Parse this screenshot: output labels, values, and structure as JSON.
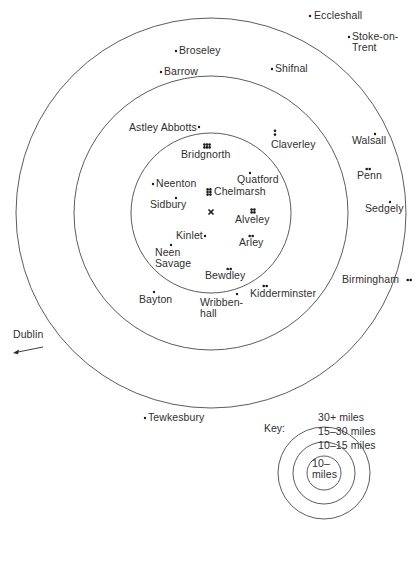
{
  "map": {
    "center_marker": {
      "x": 211,
      "y": 212,
      "symbol": "×",
      "label": ""
    },
    "rings": [
      {
        "name": "inner",
        "label": "10– miles",
        "cx": 211,
        "cy": 213,
        "r": 80
      },
      {
        "name": "middle",
        "label": "10–15 miles",
        "cx": 211,
        "cy": 213,
        "r": 137
      },
      {
        "name": "outer",
        "label": "15–30 miles",
        "cx": 211,
        "cy": 213,
        "r": 195
      }
    ],
    "places": [
      {
        "id": "eccleshall",
        "label": "Eccleshall",
        "dots": 1,
        "dot_x": 310,
        "dot_y": 16,
        "lx": 314,
        "ly": 10
      },
      {
        "id": "stoke-on-trent",
        "label": "Stoke-on-\nTrent",
        "dots": 1,
        "dot_x": 349,
        "dot_y": 37,
        "lx": 352,
        "ly": 31
      },
      {
        "id": "broseley",
        "label": "Broseley",
        "dots": 1,
        "dot_x": 176,
        "dot_y": 51,
        "lx": 179,
        "ly": 45
      },
      {
        "id": "barrow",
        "label": "Barrow",
        "dots": 1,
        "dot_x": 161,
        "dot_y": 72,
        "lx": 164,
        "ly": 66
      },
      {
        "id": "shifnal",
        "label": "Shifnal",
        "dots": 1,
        "dot_x": 272,
        "dot_y": 69,
        "lx": 275,
        "ly": 63
      },
      {
        "id": "astley-abbotts",
        "label": "Astley Abbotts",
        "dots": 1,
        "dot_x": 199,
        "dot_y": 127,
        "lx": 129,
        "ly": 122
      },
      {
        "id": "claverley",
        "label": "Claverley",
        "dots": 2,
        "dot_x": 275,
        "dot_y": 132,
        "lx": 271,
        "ly": 139,
        "arrangement": "vertical"
      },
      {
        "id": "walsall",
        "label": "Walsall",
        "dots": 1,
        "dot_x": 375,
        "dot_y": 134,
        "lx": 352,
        "ly": 135
      },
      {
        "id": "bridgnorth",
        "label": "Bridgnorth",
        "dots": 6,
        "dot_x": 207,
        "dot_y": 146,
        "lx": 181,
        "ly": 149,
        "arrangement": "grid-3x2"
      },
      {
        "id": "penn",
        "label": "Penn",
        "dots": 2,
        "dot_x": 368,
        "dot_y": 169,
        "lx": 357,
        "ly": 170,
        "arrangement": "horizontal"
      },
      {
        "id": "quatford",
        "label": "Quatford",
        "dots": 1,
        "dot_x": 250,
        "dot_y": 173,
        "lx": 237,
        "ly": 174
      },
      {
        "id": "neenton",
        "label": "Neenton",
        "dots": 1,
        "dot_x": 153,
        "dot_y": 184,
        "lx": 156,
        "ly": 178
      },
      {
        "id": "chelmarsh",
        "label": "Chelmarsh",
        "dots": 6,
        "dot_x": 209,
        "dot_y": 192,
        "lx": 214,
        "ly": 186,
        "arrangement": "grid-2x3"
      },
      {
        "id": "sidbury",
        "label": "Sidbury",
        "dots": 1,
        "dot_x": 176,
        "dot_y": 198,
        "lx": 150,
        "ly": 199
      },
      {
        "id": "sedgely",
        "label": "Sedgely",
        "dots": 1,
        "dot_x": 390,
        "dot_y": 202,
        "lx": 365,
        "ly": 203
      },
      {
        "id": "alveley",
        "label": "Alveley",
        "dots": 4,
        "dot_x": 253,
        "dot_y": 211,
        "lx": 235,
        "ly": 214,
        "arrangement": "grid-2x2"
      },
      {
        "id": "kinlet",
        "label": "Kinlet",
        "dots": 1,
        "dot_x": 205,
        "dot_y": 236,
        "lx": 176,
        "ly": 230
      },
      {
        "id": "arley",
        "label": "Arley",
        "dots": 2,
        "dot_x": 251,
        "dot_y": 236,
        "lx": 239,
        "ly": 237,
        "arrangement": "horizontal"
      },
      {
        "id": "neen-savage",
        "label": "Neen\nSavage",
        "dots": 1,
        "dot_x": 171,
        "dot_y": 245,
        "lx": 155,
        "ly": 247
      },
      {
        "id": "bewdley",
        "label": "Bewdley",
        "dots": 2,
        "dot_x": 229,
        "dot_y": 269,
        "lx": 205,
        "ly": 270,
        "arrangement": "horizontal"
      },
      {
        "id": "birmingham",
        "label": "Birmingham",
        "dots": 2,
        "dot_x": 409,
        "dot_y": 280,
        "lx": 342,
        "ly": 274,
        "arrangement": "horizontal"
      },
      {
        "id": "kidderminster",
        "label": "Kidderminster",
        "dots": 2,
        "dot_x": 265,
        "dot_y": 286,
        "lx": 250,
        "ly": 288,
        "arrangement": "horizontal"
      },
      {
        "id": "bayton",
        "label": "Bayton",
        "dots": 1,
        "dot_x": 154,
        "dot_y": 292,
        "lx": 139,
        "ly": 294
      },
      {
        "id": "wribbenhall",
        "label": "Wribben-\nhall",
        "dots": 1,
        "dot_x": 237,
        "dot_y": 294,
        "lx": 200,
        "ly": 297
      },
      {
        "id": "tewkesbury",
        "label": "Tewkesbury",
        "dots": 1,
        "dot_x": 145,
        "dot_y": 418,
        "lx": 148,
        "ly": 412
      }
    ],
    "offmap": [
      {
        "id": "dublin",
        "label": "Dublin",
        "lx": 13,
        "ly": 329,
        "arrow_from": [
          43,
          347
        ],
        "arrow_to": [
          13,
          353
        ]
      }
    ]
  },
  "key": {
    "title": "Key:",
    "title_pos": [
      264,
      422
    ],
    "cx": 324,
    "cy": 473,
    "rings": [
      {
        "r": 46,
        "label": "30+ miles",
        "lx": 318,
        "ly": 412
      },
      {
        "r": 31,
        "label": "15–30 miles",
        "lx": 318,
        "ly": 426
      },
      {
        "r": 17,
        "label": "10–15 miles",
        "lx": 318,
        "ly": 440
      }
    ],
    "inner_label": "10–\nmiles",
    "inner_label_pos": [
      312,
      458
    ]
  },
  "colors": {
    "ring": "#4a4a4a",
    "dot": "#1a1a1a",
    "text": "#2f2f2f",
    "background": "#ffffff"
  }
}
